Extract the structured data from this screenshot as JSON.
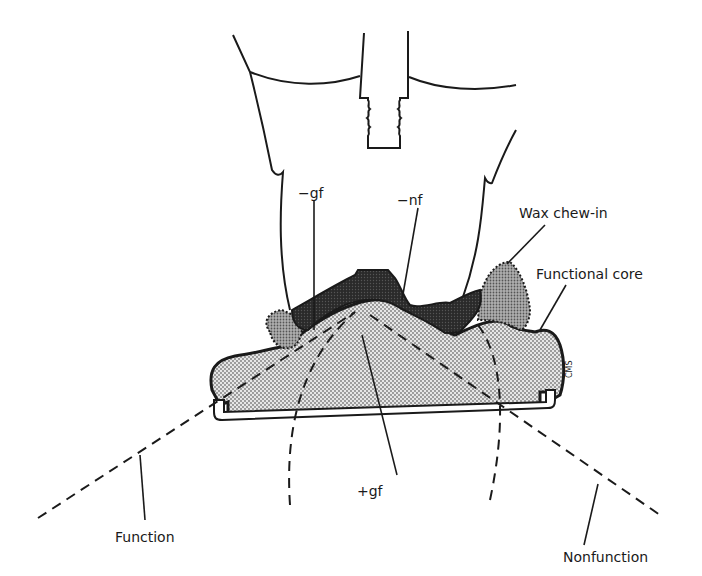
{
  "diagram": {
    "labels": {
      "minus_gf": "−gf",
      "minus_nf": "−nf",
      "wax_chew_in": "Wax chew-in",
      "functional_core": "Functional core",
      "plus_gf": "+gf",
      "function": "Function",
      "nonfunction": "Nonfunction",
      "signature": "CMS"
    },
    "colors": {
      "ink": "#1a1a1a",
      "core_fill": "#d9d9d9",
      "wax_fill": "#9a9a9a",
      "upper_tooth_fill": "#2e2e2e",
      "background": "#ffffff"
    }
  }
}
